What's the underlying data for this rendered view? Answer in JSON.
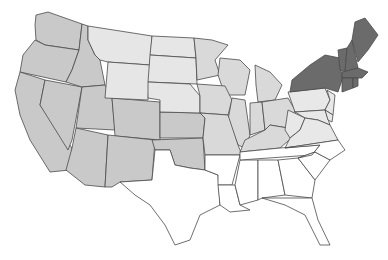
{
  "caption": "",
  "map": {
    "title": "United States by region",
    "colors": {
      "west": "#c9c9c9",
      "plains": "#e6e6e6",
      "midwest": "#d9d9d9",
      "midatlantic": "#e8e8e8",
      "northeast": "#6b6b6b",
      "south": "#ffffff",
      "border": "#4a4a4a"
    },
    "groups": {
      "west": [
        "WA",
        "OR",
        "CA",
        "NV",
        "ID",
        "UT",
        "AZ",
        "CO",
        "NM",
        "KS",
        "OK"
      ],
      "plains": [
        "MT",
        "WY",
        "ND",
        "SD",
        "NE"
      ],
      "midwest": [
        "MN",
        "WI",
        "MI",
        "IA",
        "IL",
        "IN",
        "OH",
        "MO",
        "KY"
      ],
      "midatlantic": [
        "PA",
        "NJ",
        "MD",
        "DE",
        "WV",
        "VA"
      ],
      "northeast": [
        "NY",
        "VT",
        "NH",
        "ME",
        "MA",
        "CT",
        "RI"
      ],
      "south": [
        "TX",
        "AR",
        "LA",
        "MS",
        "AL",
        "GA",
        "FL",
        "TN",
        "SC",
        "NC"
      ]
    }
  }
}
